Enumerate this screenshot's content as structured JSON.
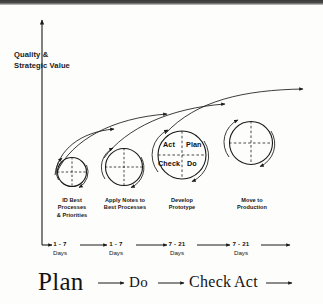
{
  "diagram": {
    "title_axis_y": "Quality &\nStrategic Value",
    "nodes": [
      {
        "label": "ID Best\nProcesses\n& Priorities"
      },
      {
        "label": "Apply Notes to\nBest Processes"
      },
      {
        "label": "Develop\nPrototype"
      },
      {
        "label": "Move to\nProduction"
      }
    ],
    "quadrants": {
      "act": "Act",
      "plan": "Plan",
      "check": "Check",
      "do": "Do"
    },
    "timeline": [
      {
        "value": "1 - 7",
        "unit": "Days"
      },
      {
        "value": "1 - 7",
        "unit": "Days"
      },
      {
        "value": "7 - 21",
        "unit": "Days"
      },
      {
        "value": "7 - 21",
        "unit": "Days"
      }
    ],
    "phases": [
      {
        "word": "Plan"
      },
      {
        "word": "Do"
      },
      {
        "word": "Check"
      },
      {
        "word": "Act"
      }
    ],
    "colors": {
      "ink": "#1a1a1a",
      "background": "#fdfdfc"
    }
  }
}
